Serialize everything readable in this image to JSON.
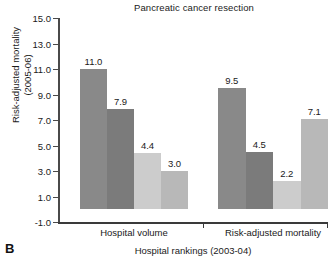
{
  "panel_label": "B",
  "chart_data": {
    "type": "bar",
    "title": "Pancreatic cancer resection",
    "xlabel": "Hospital rankings (2003-04)",
    "ylabel_line1": "Risk-adjusted mortality",
    "ylabel_line2": "(2005-06)",
    "ylim": [
      -1.0,
      15.0
    ],
    "yticks": [
      15.0,
      13.0,
      11.0,
      9.0,
      7.0,
      5.0,
      3.0,
      1.0,
      -1.0
    ],
    "ytick_labels": [
      "15.0",
      "13.0",
      "11.0",
      "9.0",
      "7.0",
      "5.0",
      "3.0",
      "1.0",
      "-1.0"
    ],
    "grid": false,
    "legend": "none",
    "groups": [
      {
        "name": "Hospital volume",
        "bars": [
          {
            "value": 11.0,
            "label": "11.0",
            "color": "#898989"
          },
          {
            "value": 7.9,
            "label": "7.9",
            "color": "#7b7b7b"
          },
          {
            "value": 4.4,
            "label": "4.4",
            "color": "#cccccc"
          },
          {
            "value": 3.0,
            "label": "3.0",
            "color": "#b8b8b8"
          }
        ]
      },
      {
        "name": "Risk-adjusted mortality",
        "bars": [
          {
            "value": 9.5,
            "label": "9.5",
            "color": "#898989"
          },
          {
            "value": 4.5,
            "label": "4.5",
            "color": "#7b7b7b"
          },
          {
            "value": 2.2,
            "label": "2.2",
            "color": "#cccccc"
          },
          {
            "value": 7.1,
            "label": "7.1",
            "color": "#b8b8b8"
          }
        ]
      }
    ]
  }
}
